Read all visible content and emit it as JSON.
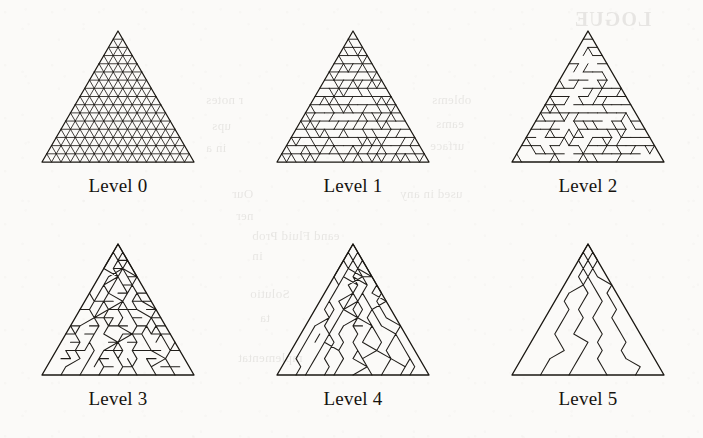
{
  "figure": {
    "background_color": "#fbfaf8",
    "ink_color": "#211e1a",
    "panel_count": 6,
    "columns": 3,
    "rows": 2
  },
  "panels": [
    {
      "id": "level-0",
      "label": "Level 0",
      "x": 20,
      "y": 25,
      "tri_left": 22,
      "tri_right": 174,
      "tri_apex_x": 98,
      "tri_top": 6,
      "tri_bottom": 137,
      "label_y": 150,
      "subdivisions": 16,
      "merge_strength": 0,
      "description": "fully subdivided uniform triangular grid"
    },
    {
      "id": "level-1",
      "label": "Level 1",
      "x": 255,
      "y": 25,
      "tri_left": 22,
      "tri_right": 174,
      "tri_apex_x": 98,
      "tri_top": 6,
      "tri_bottom": 137,
      "label_y": 150,
      "subdivisions": 16,
      "merge_strength": 1,
      "description": "adjacent triangle pairs merged into rhombi"
    },
    {
      "id": "level-2",
      "label": "Level 2",
      "x": 490,
      "y": 25,
      "tri_left": 22,
      "tri_right": 174,
      "tri_apex_x": 98,
      "tri_top": 6,
      "tri_bottom": 137,
      "label_y": 150,
      "subdivisions": 16,
      "merge_strength": 2,
      "description": "short triangle strips"
    },
    {
      "id": "level-3",
      "label": "Level 3",
      "x": 20,
      "y": 238,
      "tri_left": 22,
      "tri_right": 174,
      "tri_apex_x": 98,
      "tri_top": 6,
      "tri_bottom": 137,
      "label_y": 150,
      "subdivisions": 16,
      "merge_strength": 3,
      "description": "medium triangle strips"
    },
    {
      "id": "level-4",
      "label": "Level 4",
      "x": 255,
      "y": 238,
      "tri_left": 22,
      "tri_right": 174,
      "tri_apex_x": 98,
      "tri_top": 6,
      "tri_bottom": 137,
      "label_y": 150,
      "subdivisions": 16,
      "merge_strength": 4,
      "description": "long triangle strips"
    },
    {
      "id": "level-5",
      "label": "Level 5",
      "x": 490,
      "y": 238,
      "tri_left": 22,
      "tri_right": 174,
      "tri_apex_x": 98,
      "tri_top": 6,
      "tri_bottom": 137,
      "label_y": 150,
      "subdivisions": 16,
      "merge_strength": 5,
      "description": "very few full-length strips"
    }
  ],
  "ghost_text": [
    {
      "text": "LOGUE",
      "x": 574,
      "y": 8,
      "size": 20,
      "bold": true,
      "flip": true
    },
    {
      "text": "r notes",
      "x": 206,
      "y": 92,
      "size": 13,
      "flip": true
    },
    {
      "text": "ups",
      "x": 212,
      "y": 118,
      "size": 13,
      "flip": true
    },
    {
      "text": "in a",
      "x": 206,
      "y": 140,
      "size": 13,
      "flip": true
    },
    {
      "text": "oblems",
      "x": 432,
      "y": 92,
      "size": 13,
      "flip": true
    },
    {
      "text": "eams",
      "x": 436,
      "y": 116,
      "size": 13,
      "flip": true
    },
    {
      "text": "urface",
      "x": 430,
      "y": 138,
      "size": 13,
      "flip": true
    },
    {
      "text": "Our",
      "x": 232,
      "y": 186,
      "size": 13,
      "flip": true
    },
    {
      "text": "used in any",
      "x": 400,
      "y": 186,
      "size": 13,
      "flip": true
    },
    {
      "text": "ner",
      "x": 236,
      "y": 208,
      "size": 13,
      "flip": true
    },
    {
      "text": "mplementat",
      "x": 238,
      "y": 350,
      "size": 13,
      "flip": true
    },
    {
      "text": "eand Fluid Prob",
      "x": 252,
      "y": 228,
      "size": 13,
      "flip": true
    },
    {
      "text": "in",
      "x": 252,
      "y": 248,
      "size": 13,
      "flip": true
    },
    {
      "text": "Solutio",
      "x": 250,
      "y": 286,
      "size": 13,
      "flip": true
    },
    {
      "text": "ta",
      "x": 260,
      "y": 310,
      "size": 13,
      "flip": true
    }
  ]
}
